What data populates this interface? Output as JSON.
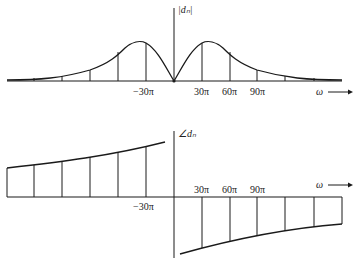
{
  "magnitude_plot": {
    "y_axis_label": "|dₙ|",
    "x_axis_label": "ω",
    "tick_labels": {
      "neg30": "−30π",
      "pos30": "30π",
      "pos60": "60π",
      "pos90": "90π"
    }
  },
  "phase_plot": {
    "y_axis_label": "∠dₙ",
    "x_axis_label": "ω",
    "tick_labels": {
      "neg30": "−30π",
      "pos30": "30π",
      "pos60": "60π",
      "pos90": "90π"
    }
  },
  "colors": {
    "ink": "#1a1a1a",
    "background": "#ffffff"
  }
}
